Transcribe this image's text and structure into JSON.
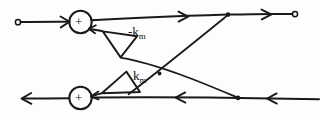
{
  "diagram": {
    "style": "hand-drawn pen sketch, black ink on white paper",
    "ink_color": "#141414",
    "paper_color": "#fdfdfc",
    "summing_junctions": [
      {
        "id": "sum-top",
        "sign_label": "+",
        "cx": 80,
        "cy": 22,
        "r": 11
      },
      {
        "id": "sum-bottom",
        "sign_label": "+",
        "cx": 80,
        "cy": 98,
        "r": 11
      }
    ],
    "gain_blocks": [
      {
        "id": "gain-top",
        "label_text": "-k",
        "label_sub": "m",
        "shape": "triangle",
        "points": "103,31 137,36 121,57"
      },
      {
        "id": "gain-bottom",
        "label_text": "k",
        "label_sub": "m",
        "shape": "triangle",
        "points": "102,93 126,72 140,92"
      }
    ],
    "terminals": [
      {
        "id": "input-terminal",
        "kind": "open-circle",
        "cx": 18,
        "cy": 22,
        "r": 2.6
      },
      {
        "id": "output-terminal",
        "kind": "open-circle",
        "cx": 295,
        "cy": 14,
        "r": 2.6
      }
    ],
    "nodes": [
      {
        "id": "node-top-branch",
        "cx": 228,
        "cy": 14.5,
        "r": 2.2
      },
      {
        "id": "node-bottom-branch",
        "cx": 238,
        "cy": 98,
        "r": 2.2
      },
      {
        "id": "node-crossing",
        "cx": 158,
        "cy": 73,
        "r": 1.8
      }
    ],
    "edges": [
      {
        "id": "edge-input-to-top-sum",
        "from": "input-terminal",
        "to": "sum-top",
        "direction": "right",
        "arrow": true
      },
      {
        "id": "edge-top-sum-to-output",
        "from": "sum-top",
        "to": "output-terminal",
        "direction": "right",
        "arrow": true
      },
      {
        "id": "edge-top-node-to-bottom-gain",
        "from": "node-top-branch",
        "to": "gain-bottom",
        "direction": "down-left",
        "arrow": false
      },
      {
        "id": "edge-bottom-node-to-top-gain",
        "from": "node-bottom-branch",
        "to": "gain-top",
        "direction": "up-left",
        "arrow": false
      },
      {
        "id": "edge-top-gain-to-top-sum",
        "from": "gain-top",
        "to": "sum-top",
        "direction": "up-left",
        "arrow": true
      },
      {
        "id": "edge-bottom-gain-to-bottom-sum",
        "from": "gain-bottom",
        "to": "sum-bottom",
        "direction": "down-left",
        "arrow": true
      },
      {
        "id": "edge-bottom-sum-to-left-output",
        "from": "sum-bottom",
        "to": "left-edge",
        "direction": "left",
        "arrow": true
      },
      {
        "id": "edge-right-to-bottom-sum",
        "from": "right-edge",
        "to": "sum-bottom",
        "direction": "left",
        "arrow": true
      }
    ],
    "labels": {
      "gain_top": {
        "main": "-k",
        "sub": "m"
      },
      "gain_bottom": {
        "main": "k",
        "sub": "m"
      },
      "sum_top": "+",
      "sum_bottom": "+"
    }
  }
}
